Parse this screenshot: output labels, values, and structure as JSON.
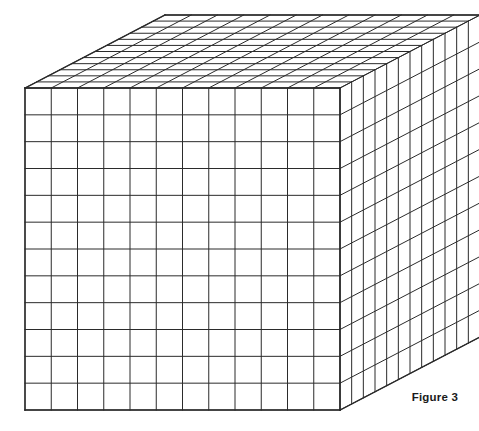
{
  "figure": {
    "caption": "Figure 3",
    "title": "",
    "projection": "oblique-cabinet",
    "background_color": "#ffffff",
    "line_color": "#2b2b2b",
    "line_width": 1,
    "dimensions": {
      "width_units": 12,
      "height_units": 12,
      "depth_units": 12,
      "total_unit_cubes": 1728,
      "front_face_squares": 144,
      "top_face_squares": 144,
      "right_face_squares": 144
    },
    "geometry": {
      "front_top_left": [
        25,
        88
      ],
      "front_top_right": [
        340,
        88
      ],
      "front_bottom_left": [
        25,
        410
      ],
      "front_bottom_right": [
        340,
        410
      ],
      "back_top_left": [
        165,
        15
      ],
      "back_top_right": [
        452,
        15
      ],
      "back_bottom_right": [
        452,
        333
      ]
    },
    "faces": [
      {
        "name": "front-face",
        "label": "front",
        "columns": 12,
        "rows": 12
      },
      {
        "name": "top-face",
        "label": "top",
        "columns": 12,
        "rows": 12
      },
      {
        "name": "right-face",
        "label": "right",
        "columns": 12,
        "rows": 12
      }
    ]
  }
}
